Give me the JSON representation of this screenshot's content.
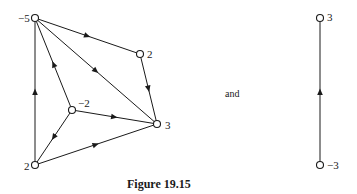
{
  "figure": {
    "caption": "Figure 19.15",
    "connector_text": "and"
  },
  "graph_left": {
    "nodes": [
      {
        "id": "A",
        "label": "−5",
        "x": 35,
        "y": 18
      },
      {
        "id": "B",
        "label": "2",
        "x": 140,
        "y": 54
      },
      {
        "id": "C",
        "label": "−2",
        "x": 72,
        "y": 110
      },
      {
        "id": "D",
        "label": "3",
        "x": 157,
        "y": 124
      },
      {
        "id": "E",
        "label": "2",
        "x": 35,
        "y": 165
      }
    ],
    "edges": [
      {
        "from": "A",
        "to": "B"
      },
      {
        "from": "B",
        "to": "D"
      },
      {
        "from": "A",
        "to": "D"
      },
      {
        "from": "C",
        "to": "A"
      },
      {
        "from": "C",
        "to": "D"
      },
      {
        "from": "C",
        "to": "E"
      },
      {
        "from": "E",
        "to": "A"
      },
      {
        "from": "E",
        "to": "D"
      }
    ]
  },
  "graph_right": {
    "nodes": [
      {
        "id": "T",
        "label": "3",
        "x": 320,
        "y": 18
      },
      {
        "id": "U",
        "label": "−3",
        "x": 320,
        "y": 165
      }
    ],
    "edges": [
      {
        "from": "U",
        "to": "T"
      }
    ]
  },
  "colors": {
    "stroke": "#1a1a1a",
    "node_fill": "#ffffff"
  }
}
